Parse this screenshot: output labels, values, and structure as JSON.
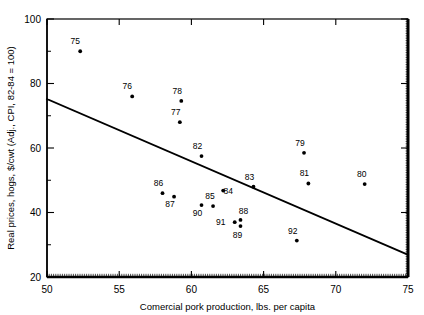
{
  "chart_data": {
    "type": "scatter",
    "title": "",
    "xlabel": "Comercial pork production, lbs. per capita",
    "ylabel": "Real prices, hogs, $/cwt (Adj., CPI, 82-84 = 100)",
    "xlim": [
      50,
      75
    ],
    "ylim": [
      20,
      100
    ],
    "xticks": [
      50,
      55,
      60,
      65,
      70,
      75
    ],
    "xtick_labels": [
      "50",
      "55",
      "60",
      "65",
      "70",
      "75"
    ],
    "yticks": [
      20,
      40,
      60,
      80,
      100
    ],
    "ytick_labels": [
      "20",
      "40",
      "60",
      "80",
      "100"
    ],
    "yminor_ticks": [
      30,
      50,
      70,
      90
    ],
    "grid": false,
    "legend": false,
    "legend_position": "none",
    "point_color": "#000000",
    "line_color": "#000000",
    "points": [
      {
        "label": "75",
        "x": 52.3,
        "y": 90.0,
        "label_dx": -5,
        "label_dy": -7
      },
      {
        "label": "76",
        "x": 55.9,
        "y": 76.0,
        "label_dx": -5,
        "label_dy": -7
      },
      {
        "label": "78",
        "x": 59.3,
        "y": 74.6,
        "label_dx": -4,
        "label_dy": -7
      },
      {
        "label": "77",
        "x": 59.2,
        "y": 68.0,
        "label_dx": -4,
        "label_dy": -7
      },
      {
        "label": "82",
        "x": 60.7,
        "y": 57.5,
        "label_dx": -4,
        "label_dy": -7
      },
      {
        "label": "79",
        "x": 67.8,
        "y": 58.5,
        "label_dx": -4,
        "label_dy": -7
      },
      {
        "label": "81",
        "x": 68.1,
        "y": 49.0,
        "label_dx": -4,
        "label_dy": -7
      },
      {
        "label": "80",
        "x": 72.0,
        "y": 48.8,
        "label_dx": -3,
        "label_dy": -7
      },
      {
        "label": "83",
        "x": 64.3,
        "y": 48.0,
        "label_dx": -4,
        "label_dy": -7
      },
      {
        "label": "84",
        "x": 62.2,
        "y": 46.8,
        "label_dx": 5,
        "label_dy": 3
      },
      {
        "label": "86",
        "x": 58.0,
        "y": 46.0,
        "label_dx": -4,
        "label_dy": -7
      },
      {
        "label": "87",
        "x": 58.8,
        "y": 44.9,
        "label_dx": -4,
        "label_dy": 10
      },
      {
        "label": "85",
        "x": 61.5,
        "y": 42.0,
        "label_dx": -3,
        "label_dy": -7
      },
      {
        "label": "90",
        "x": 60.7,
        "y": 42.3,
        "label_dx": -4,
        "label_dy": 11
      },
      {
        "label": "88",
        "x": 63.4,
        "y": 37.7,
        "label_dx": 3,
        "label_dy": -6
      },
      {
        "label": "91",
        "x": 63.0,
        "y": 37.0,
        "label_dx": -14,
        "label_dy": 3
      },
      {
        "label": "89",
        "x": 63.4,
        "y": 35.8,
        "label_dx": -3,
        "label_dy": 12
      },
      {
        "label": "92",
        "x": 67.3,
        "y": 31.3,
        "label_dx": -4,
        "label_dy": -7
      }
    ],
    "trend_line": {
      "name": "regression-line",
      "x0": 50.0,
      "y0": 75.2,
      "x1": 75.0,
      "y1": 26.9
    }
  }
}
